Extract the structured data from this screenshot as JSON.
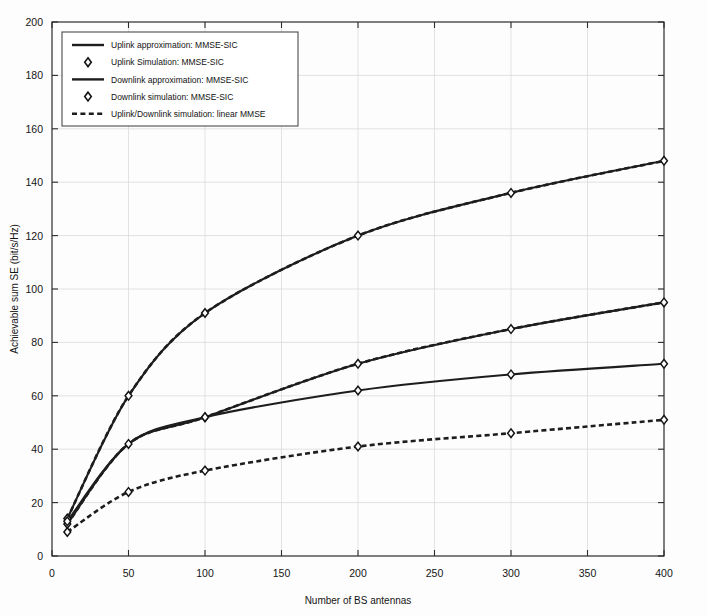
{
  "chart_data": {
    "type": "line",
    "title": "",
    "xlabel": "Number of BS antennas",
    "ylabel": "Achievable sum SE (bit/s/Hz)",
    "xlim": [
      0,
      400
    ],
    "ylim": [
      0,
      200
    ],
    "xticks": [
      0,
      50,
      100,
      150,
      200,
      250,
      300,
      350,
      400
    ],
    "xtick_labels": [
      "0",
      "50",
      "100",
      "150",
      "200",
      "250",
      "300",
      "350",
      "400"
    ],
    "yticks": [
      0,
      20,
      40,
      60,
      80,
      100,
      120,
      140,
      160,
      180,
      200
    ],
    "ytick_labels": [
      "0",
      "20",
      "40",
      "60",
      "80",
      "100",
      "120",
      "140",
      "160",
      "180",
      "200"
    ],
    "grid": true,
    "legend_position": "upper left",
    "x": [
      10,
      50,
      100,
      200,
      300,
      400
    ],
    "series": [
      {
        "name": "Uplink approximation: MMSE-SIC",
        "style": "solid",
        "marker": "none",
        "values": [
          14,
          60,
          91,
          120,
          136,
          148
        ]
      },
      {
        "name": "Uplink Simulation: MMSE-SIC",
        "style": "marker",
        "marker": "diamond",
        "values": [
          14,
          60,
          91,
          120,
          136,
          148
        ]
      },
      {
        "name": "Downlink approximation: MMSE-SIC",
        "style": "solid",
        "marker": "none",
        "values": [
          12,
          42,
          52,
          72,
          85,
          95
        ]
      },
      {
        "name": "Downlink simulation: MMSE-SIC",
        "style": "marker",
        "marker": "diamond",
        "values": [
          12,
          42,
          52,
          72,
          85,
          95
        ]
      },
      {
        "name": "Uplink/Downlink simulation: linear MMSE",
        "style": "dashed",
        "marker": "none",
        "values": [
          11,
          59,
          52,
          62,
          68,
          72
        ]
      }
    ],
    "curves": [
      {
        "id": "uplink-mmse-sic",
        "label": "Uplink approximation: MMSE-SIC",
        "style": "solid-with-dash-overlay",
        "points": [
          [
            10,
            14
          ],
          [
            50,
            60
          ],
          [
            100,
            91
          ],
          [
            200,
            120
          ],
          [
            300,
            136
          ],
          [
            400,
            148
          ]
        ],
        "markers_at": [
          10,
          50,
          100,
          200,
          300,
          400
        ]
      },
      {
        "id": "downlink-mmse-sic",
        "label": "Downlink approximation: MMSE-SIC",
        "style": "solid-with-dash-overlay",
        "points": [
          [
            10,
            12
          ],
          [
            50,
            42
          ],
          [
            100,
            52
          ],
          [
            200,
            72
          ],
          [
            300,
            85
          ],
          [
            400,
            95
          ]
        ],
        "markers_at": [
          10,
          50,
          100,
          200,
          300,
          400
        ]
      },
      {
        "id": "uplink-linear-mmse",
        "label": "Uplink/Downlink simulation: linear MMSE (upper)",
        "style": "solid",
        "points": [
          [
            10,
            13
          ],
          [
            50,
            42
          ],
          [
            100,
            52
          ],
          [
            200,
            62
          ],
          [
            300,
            68
          ],
          [
            400,
            72
          ]
        ],
        "markers_at": [
          10,
          100,
          200,
          300,
          400
        ]
      },
      {
        "id": "downlink-linear-mmse",
        "label": "Uplink/Downlink simulation: linear MMSE (lower)",
        "style": "dashed",
        "points": [
          [
            10,
            9
          ],
          [
            50,
            24
          ],
          [
            100,
            32
          ],
          [
            200,
            41
          ],
          [
            300,
            46
          ],
          [
            400,
            51
          ]
        ],
        "markers_at": [
          10,
          50,
          100,
          200,
          300,
          400
        ]
      }
    ],
    "legend": [
      {
        "label": "Uplink approximation: MMSE-SIC",
        "glyph": "line"
      },
      {
        "label": "Uplink Simulation: MMSE-SIC",
        "glyph": "diamond"
      },
      {
        "label": "Downlink approximation: MMSE-SIC",
        "glyph": "line"
      },
      {
        "label": "Downlink simulation: MMSE-SIC",
        "glyph": "diamond"
      },
      {
        "label": "Uplink/Downlink simulation: linear MMSE",
        "glyph": "dashed"
      }
    ],
    "colors": {
      "line": "#1d1d1d",
      "grid": "#d7d7d7",
      "axis": "#2b2b2b",
      "background": "#fdfdfd"
    }
  }
}
